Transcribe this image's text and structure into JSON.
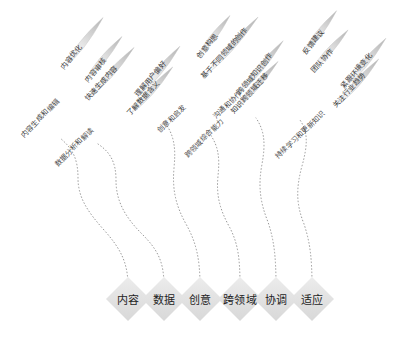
{
  "diagram": {
    "background_color": "#ffffff",
    "stem_color": "#8d8d8d",
    "node_fill": "#e2e2e2",
    "leaf_fill_light": "#f3f3f3",
    "leaf_fill_dark": "#b9b9b9",
    "branches": [
      {
        "node": "内容",
        "node_x": 128,
        "node_y": 299,
        "stem_label": "内容生成和编辑",
        "stem_label_x": 22,
        "stem_label_y": 131,
        "stem_label_rotate": -46,
        "path": "M128,286 C128,262 120,248 104,230 C88,212 78,198 78,178 C78,158 72,148 60,138",
        "leaves": [
          {
            "label": "内容优化",
            "cx": 84,
            "cy": 42,
            "angle": -52,
            "len": 62,
            "wid": 13,
            "lx": 62,
            "ly": 63,
            "lrot": -52
          },
          {
            "label": "内容审核",
            "cx": 104,
            "cy": 58,
            "angle": -50,
            "len": 56,
            "wid": 12,
            "lx": 86,
            "ly": 76,
            "lrot": -50
          },
          {
            "label": "快速生成内容",
            "cx": 112,
            "cy": 72,
            "angle": -48,
            "len": 66,
            "wid": 13,
            "lx": 86,
            "ly": 94,
            "lrot": -48
          }
        ]
      },
      {
        "node": "数据",
        "node_x": 164,
        "node_y": 299,
        "stem_label": "数据分析和解读",
        "stem_label_x": 56,
        "stem_label_y": 160,
        "stem_label_rotate": -46,
        "path": "M164,286 C164,262 158,250 142,234 C124,216 116,200 116,180 C116,162 110,152 98,144",
        "leaves": [
          {
            "label": "理解用户偏好",
            "cx": 160,
            "cy": 70,
            "angle": -50,
            "len": 62,
            "wid": 13,
            "lx": 136,
            "ly": 90,
            "lrot": -50
          },
          {
            "label": "了解数据含义",
            "cx": 152,
            "cy": 90,
            "angle": -48,
            "len": 62,
            "wid": 13,
            "lx": 128,
            "ly": 109,
            "lrot": -48
          }
        ]
      },
      {
        "node": "创意",
        "node_x": 200,
        "node_y": 299,
        "stem_label": "创意和启发",
        "stem_label_x": 158,
        "stem_label_y": 126,
        "stem_label_rotate": -44,
        "path": "M200,286 C200,258 196,242 186,224 C176,206 172,190 174,168 C176,148 174,136 166,124",
        "leaves": [
          {
            "label": "创意构思",
            "cx": 214,
            "cy": 36,
            "angle": -52,
            "len": 52,
            "wid": 12,
            "lx": 198,
            "ly": 52,
            "lrot": -52
          },
          {
            "label": "基于不同领域的创作",
            "cx": 232,
            "cy": 46,
            "angle": -48,
            "len": 78,
            "wid": 13,
            "lx": 202,
            "ly": 72,
            "lrot": -48
          }
        ]
      },
      {
        "node": "跨领域",
        "node_x": 240,
        "node_y": 299,
        "stem_label": "跨领域综合能力",
        "stem_label_x": 186,
        "stem_label_y": 151,
        "stem_label_rotate": -46,
        "path": "M240,286 C240,258 238,244 230,228 C220,210 216,196 218,176 C220,156 218,146 210,134",
        "leaves": [
          {
            "label": "跨领域知识创作",
            "cx": 262,
            "cy": 66,
            "angle": -50,
            "len": 66,
            "wid": 13,
            "lx": 238,
            "ly": 88,
            "lrot": -50
          },
          {
            "label": "知识跨领域迁移",
            "cx": 256,
            "cy": 86,
            "angle": -48,
            "len": 66,
            "wid": 13,
            "lx": 232,
            "ly": 107,
            "lrot": -48
          }
        ]
      },
      {
        "node": "协调",
        "node_x": 276,
        "node_y": 299,
        "stem_label": "沟通和协作",
        "stem_label_x": 214,
        "stem_label_y": 112,
        "stem_label_rotate": -44,
        "path": "M276,286 C276,256 274,240 268,222 C260,202 258,186 262,164 C266,142 264,130 256,118",
        "leaves": [
          {
            "label": "反馈建议",
            "cx": 320,
            "cy": 32,
            "angle": -52,
            "len": 54,
            "wid": 12,
            "lx": 304,
            "ly": 48,
            "lrot": -52
          },
          {
            "label": "团队协作",
            "cx": 330,
            "cy": 50,
            "angle": -48,
            "len": 54,
            "wid": 12,
            "lx": 312,
            "ly": 66,
            "lrot": -48
          }
        ]
      },
      {
        "node": "适应",
        "node_x": 312,
        "node_y": 299,
        "stem_label": "持续学习和更新知识",
        "stem_label_x": 276,
        "stem_label_y": 152,
        "stem_label_rotate": -44,
        "path": "M312,286 C312,258 310,242 304,224 C296,204 296,188 302,166 C308,144 308,132 300,120",
        "leaves": [
          {
            "label": "紧跟环境变化",
            "cx": 366,
            "cy": 62,
            "angle": -50,
            "len": 62,
            "wid": 13,
            "lx": 342,
            "ly": 82,
            "lrot": -50
          },
          {
            "label": "关注行业趋势",
            "cx": 358,
            "cy": 82,
            "angle": -48,
            "len": 62,
            "wid": 13,
            "lx": 334,
            "ly": 101,
            "lrot": -48
          }
        ]
      }
    ]
  }
}
